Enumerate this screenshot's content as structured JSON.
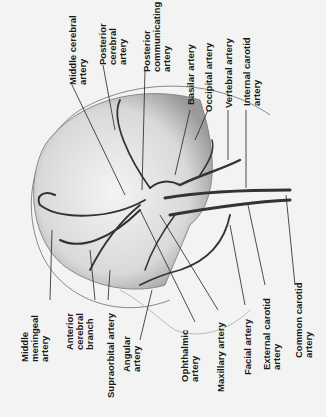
{
  "figure": {
    "top_labels": [
      {
        "lines": [
          "Middle cerebral",
          "artery"
        ]
      },
      {
        "lines": [
          "Posterior",
          "cerebral",
          "artery"
        ]
      },
      {
        "lines": [
          "Posterior",
          "communicating",
          "artery"
        ]
      },
      {
        "lines": [
          "Basilar artery"
        ]
      },
      {
        "lines": [
          "Occipital artery"
        ]
      },
      {
        "lines": [
          "Vertebral artery"
        ]
      },
      {
        "lines": [
          "Internal carotid",
          "artery"
        ]
      }
    ],
    "bottom_labels": [
      {
        "lines": [
          "Middle",
          "meningeal",
          "artery"
        ]
      },
      {
        "lines": [
          "Anterior",
          "cerebral",
          "branch"
        ]
      },
      {
        "lines": [
          "Supraorbital artery"
        ]
      },
      {
        "lines": [
          "Angular",
          "artery"
        ]
      },
      {
        "lines": [
          "Ophthalmic",
          "artery"
        ]
      },
      {
        "lines": [
          "Maxillary artery"
        ]
      },
      {
        "lines": [
          "Facial artery"
        ]
      },
      {
        "lines": [
          "External carotid",
          "artery"
        ]
      },
      {
        "lines": [
          "Common carotid",
          "artery"
        ]
      }
    ]
  }
}
